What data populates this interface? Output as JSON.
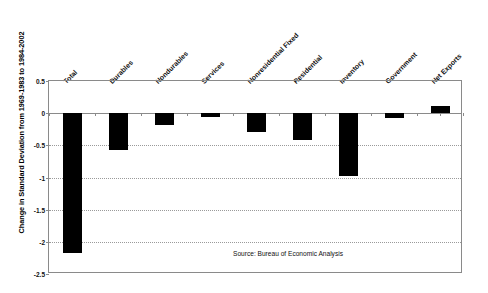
{
  "chart_data": {
    "type": "bar",
    "title": "",
    "subtitle": "",
    "xlabel": "",
    "ylabel": "Change in Standard Deviation from 1969-1983 to 1984-2002",
    "ylim": [
      -2.5,
      0.5
    ],
    "yticks": [
      "0.5",
      "0",
      "-0.5",
      "-1",
      "-1.5",
      "-2",
      "-2.5"
    ],
    "ytick_values": [
      0.5,
      0,
      -0.5,
      -1,
      -1.5,
      -2,
      -2.5
    ],
    "grid": true,
    "legend": false,
    "categories": [
      "Total",
      "Durables",
      "Nondurables",
      "Services",
      "Nonresidential Fixed",
      "Residential",
      "Inventory",
      "Government",
      "Net Exports"
    ],
    "values": [
      -2.18,
      -0.57,
      -0.19,
      -0.06,
      -0.3,
      -0.42,
      -0.97,
      -0.07,
      0.11
    ],
    "bar_color": "#000000",
    "annotations": [
      "Source: Bureau of Economic Analysis"
    ]
  },
  "source_note": "Source: Bureau of Economic Analysis",
  "axis": {
    "line_color": "#8a8a8a",
    "grid_color": "#9a9a9a"
  }
}
